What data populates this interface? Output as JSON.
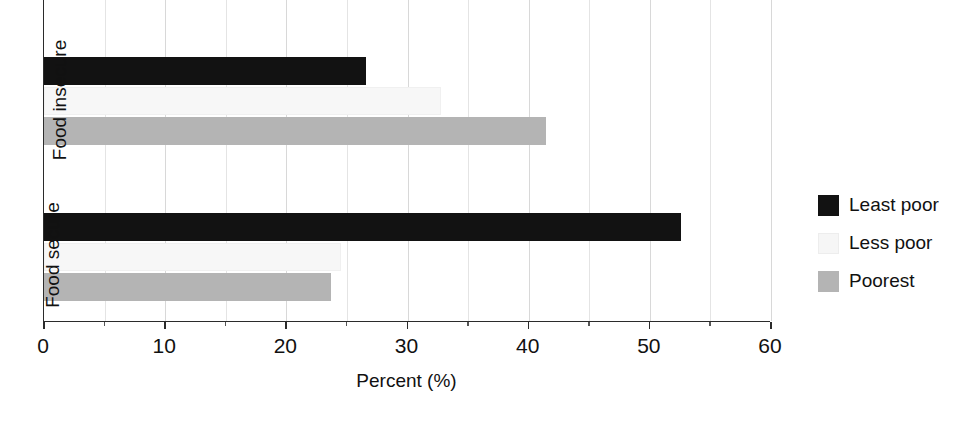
{
  "chart_data": {
    "type": "bar",
    "orientation": "horizontal",
    "title": "",
    "xlabel": "Percent (%)",
    "ylabel": "",
    "xlim": [
      0,
      60
    ],
    "xticks": [
      0,
      10,
      20,
      30,
      40,
      50,
      60
    ],
    "xtick_labels": [
      "0",
      "10",
      "20",
      "30",
      "40",
      "50",
      "60"
    ],
    "grid": true,
    "grid_axis": "x",
    "legend_position": "right",
    "categories": [
      "Food insecure",
      "Food secure"
    ],
    "series": [
      {
        "name": "Least poor",
        "color": "#121212",
        "values": [
          26.6,
          52.6
        ]
      },
      {
        "name": "Less poor",
        "color": "#f7f7f7",
        "values": [
          32.8,
          24.5
        ]
      },
      {
        "name": "Poorest",
        "color": "#b4b4b4",
        "values": [
          41.4,
          23.7
        ]
      }
    ]
  },
  "axes": {
    "x_title": "Percent (%)",
    "x_ticks": [
      {
        "value": 0,
        "label": "0"
      },
      {
        "value": 10,
        "label": "10"
      },
      {
        "value": 20,
        "label": "20"
      },
      {
        "value": 30,
        "label": "30"
      },
      {
        "value": 40,
        "label": "40"
      },
      {
        "value": 50,
        "label": "50"
      },
      {
        "value": 60,
        "label": "60"
      }
    ],
    "y_categories": [
      {
        "label": "Food insecure"
      },
      {
        "label": "Food secure"
      }
    ]
  },
  "legend": {
    "items": [
      {
        "label": "Least poor",
        "color": "#121212"
      },
      {
        "label": "Less poor",
        "color": "#f7f7f7"
      },
      {
        "label": "Poorest",
        "color": "#b4b4b4"
      }
    ]
  }
}
